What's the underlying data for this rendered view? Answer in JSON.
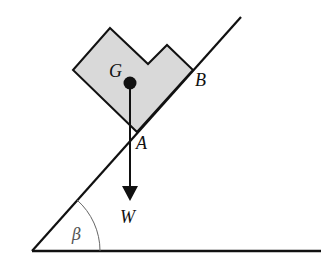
{
  "figure": {
    "labels": {
      "centre_of_mass": "G",
      "point_a": "A",
      "point_b": "B",
      "weight": "W",
      "angle": "β"
    },
    "colors": {
      "block_fill": "#d9d9d9",
      "line": "#111111",
      "angle_arc": "#666666"
    }
  }
}
